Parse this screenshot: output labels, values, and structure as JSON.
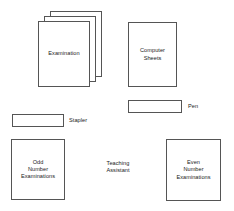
{
  "diagram": {
    "background_color": "#ffffff",
    "stroke_color": "#555555",
    "text_color": "#1a1a1a",
    "objects": [
      {
        "id": "examination-stack",
        "label": "Examination",
        "kind": "paper-stack",
        "sheets": 3,
        "x": 38,
        "y": 21,
        "w": 52,
        "h": 66,
        "offset_x": 6,
        "offset_y": 5
      },
      {
        "id": "computer-sheets",
        "label": "Computer\nSheets",
        "kind": "paper",
        "x": 128,
        "y": 22,
        "w": 49,
        "h": 65
      },
      {
        "id": "pen",
        "label": "Pen",
        "kind": "object",
        "x": 128,
        "y": 100,
        "w": 54,
        "h": 13,
        "label_position": "right",
        "label_x": 188,
        "label_y": 101
      },
      {
        "id": "stapler",
        "label": "Stapler",
        "kind": "object",
        "x": 12,
        "y": 114,
        "w": 52,
        "h": 13,
        "label_position": "right",
        "label_x": 69,
        "label_y": 115
      },
      {
        "id": "odd-number-examinations",
        "label": "Odd\nNumber\nExaminations",
        "kind": "paper",
        "x": 11,
        "y": 139,
        "w": 54,
        "h": 61
      },
      {
        "id": "teaching-assistant",
        "label": "Teaching\nAssistant",
        "kind": "text-only",
        "x": 94,
        "y": 158,
        "w": 48,
        "h": 18
      },
      {
        "id": "even-number-examinations",
        "label": "Even\nNumber\nExaminations",
        "kind": "paper",
        "x": 166,
        "y": 139,
        "w": 55,
        "h": 62
      }
    ]
  }
}
